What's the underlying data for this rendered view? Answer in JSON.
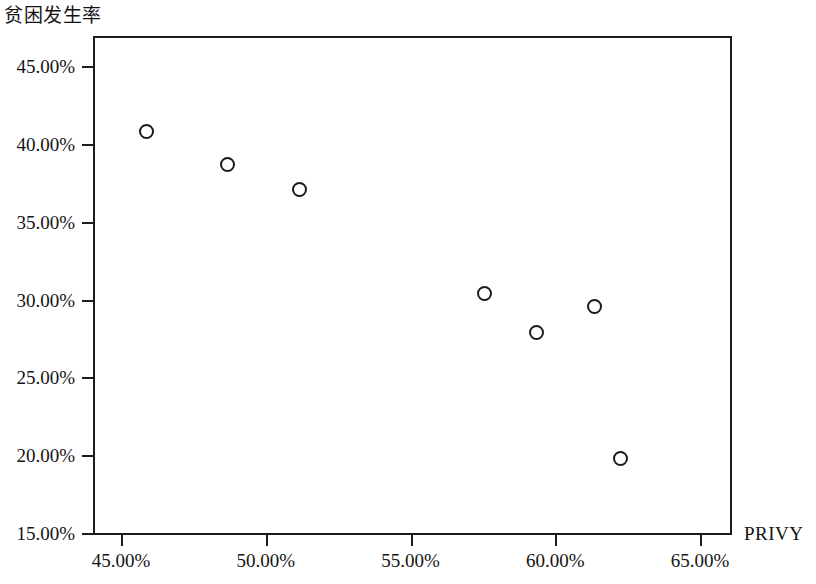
{
  "chart_data": {
    "type": "scatter",
    "title": "",
    "subtitle": "",
    "xlabel": "PRIVY",
    "ylabel": "贫困发生率",
    "xlim": [
      43.9,
      66.0
    ],
    "ylim": [
      14.0,
      46.0
    ],
    "grid": false,
    "legend": null,
    "x_tick_labels": [
      "45.00%",
      "50.00%",
      "55.00%",
      "60.00%",
      "65.00%"
    ],
    "x_tick_values": [
      45,
      50,
      55,
      60,
      65
    ],
    "y_tick_labels": [
      "15.00%",
      "20.00%",
      "25.00%",
      "30.00%",
      "35.00%",
      "40.00%",
      "45.00%"
    ],
    "y_tick_values": [
      15,
      20,
      25,
      30,
      35,
      40,
      45
    ],
    "marker": "open-circle",
    "marker_color": "#1b1b1b",
    "points": [
      {
        "x": 45.8,
        "y": 40.9
      },
      {
        "x": 48.6,
        "y": 38.8
      },
      {
        "x": 51.1,
        "y": 37.2
      },
      {
        "x": 57.5,
        "y": 30.5
      },
      {
        "x": 59.3,
        "y": 28.0
      },
      {
        "x": 61.3,
        "y": 29.7
      },
      {
        "x": 62.2,
        "y": 19.9
      }
    ]
  }
}
